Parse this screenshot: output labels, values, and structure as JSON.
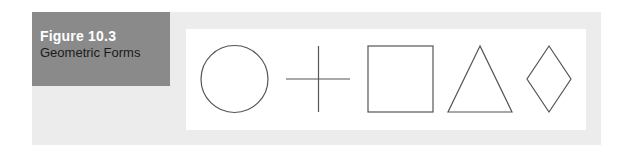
{
  "figure": {
    "number": "Figure 10.3",
    "title": "Geometric Forms"
  },
  "shapes": [
    {
      "name": "circle"
    },
    {
      "name": "cross"
    },
    {
      "name": "square"
    },
    {
      "name": "triangle"
    },
    {
      "name": "diamond"
    }
  ],
  "colors": {
    "label_box": "#8a8a8a",
    "panel": "#ececec",
    "stroke": "#555555"
  }
}
